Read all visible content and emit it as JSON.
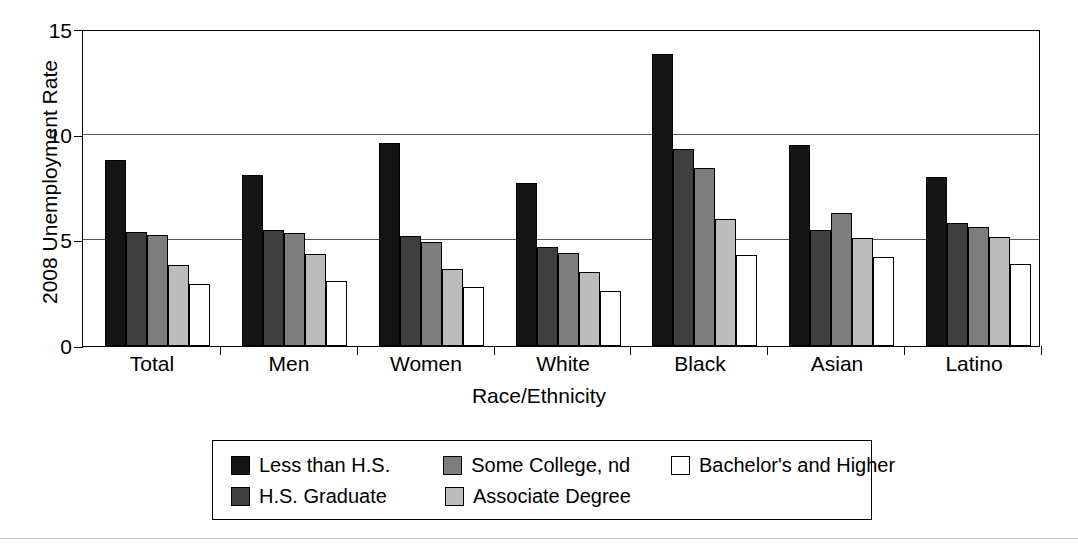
{
  "chart_data": {
    "type": "bar",
    "title": "",
    "xlabel": "Race/Ethnicity",
    "ylabel": "2008 Unemployment Rate",
    "ylim": [
      0,
      15
    ],
    "yticks": [
      0,
      5,
      10,
      15
    ],
    "ytick_labels": [
      "0",
      "5",
      "10",
      "15"
    ],
    "grid": true,
    "grid_axis": "y",
    "legend_position": "below-center",
    "categories": [
      "Total",
      "Men",
      "Women",
      "White",
      "Black",
      "Asian",
      "Latino"
    ],
    "series": [
      {
        "name": "Less than H.S.",
        "color": "#151515",
        "values": [
          8.8,
          8.1,
          9.6,
          7.7,
          13.8,
          9.5,
          8.0
        ]
      },
      {
        "name": "H.S. Graduate",
        "color": "#3f3f3f",
        "values": [
          5.4,
          5.5,
          5.2,
          4.7,
          9.3,
          5.5,
          5.8
        ]
      },
      {
        "name": "Some College, nd",
        "color": "#7d7d7d",
        "values": [
          5.25,
          5.35,
          4.9,
          4.4,
          8.4,
          6.3,
          5.65
        ]
      },
      {
        "name": "Associate Degree",
        "color": "#bcbcbc",
        "values": [
          3.85,
          4.35,
          3.65,
          3.5,
          6.0,
          5.1,
          5.15
        ]
      },
      {
        "name": "Bachelor's and Higher",
        "color": "#ffffff",
        "values": [
          2.95,
          3.1,
          2.8,
          2.6,
          4.3,
          4.2,
          3.9
        ]
      }
    ]
  },
  "legend": {
    "rows": [
      [
        {
          "label": "Less than H.S.",
          "color": "#151515"
        },
        {
          "label": "Some College, nd",
          "color": "#7d7d7d"
        },
        {
          "label": "Bachelor's and Higher",
          "color": "#ffffff"
        }
      ],
      [
        {
          "label": "H.S. Graduate",
          "color": "#3f3f3f"
        },
        {
          "label": "Associate Degree",
          "color": "#bcbcbc"
        }
      ]
    ]
  }
}
